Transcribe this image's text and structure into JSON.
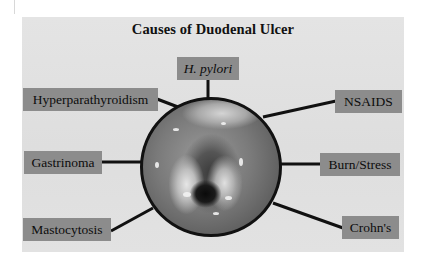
{
  "title": "Causes of Duodenal Ulcer",
  "center_image": {
    "description": "endoscopic view of duodenal ulcer",
    "shape": "circle"
  },
  "causes": [
    {
      "id": "h-pylori",
      "label": "H. pylori",
      "italic": true,
      "position": "top"
    },
    {
      "id": "hyperparathyroidism",
      "label": "Hyperparathyroidism",
      "italic": false,
      "position": "upper-left"
    },
    {
      "id": "nsaids",
      "label": "NSAIDS",
      "italic": false,
      "position": "upper-right"
    },
    {
      "id": "gastrinoma",
      "label": "Gastrinoma",
      "italic": false,
      "position": "left"
    },
    {
      "id": "burn-stress",
      "label": "Burn/Stress",
      "italic": false,
      "position": "right"
    },
    {
      "id": "mastocytosis",
      "label": "Mastocytosis",
      "italic": false,
      "position": "lower-left"
    },
    {
      "id": "crohns",
      "label": "Crohn's",
      "italic": false,
      "position": "lower-right"
    }
  ],
  "colors": {
    "panel": "#e2e2e2",
    "label_box": "#8c8c8c",
    "connector": "#111111",
    "text": "#0d0d0d"
  }
}
